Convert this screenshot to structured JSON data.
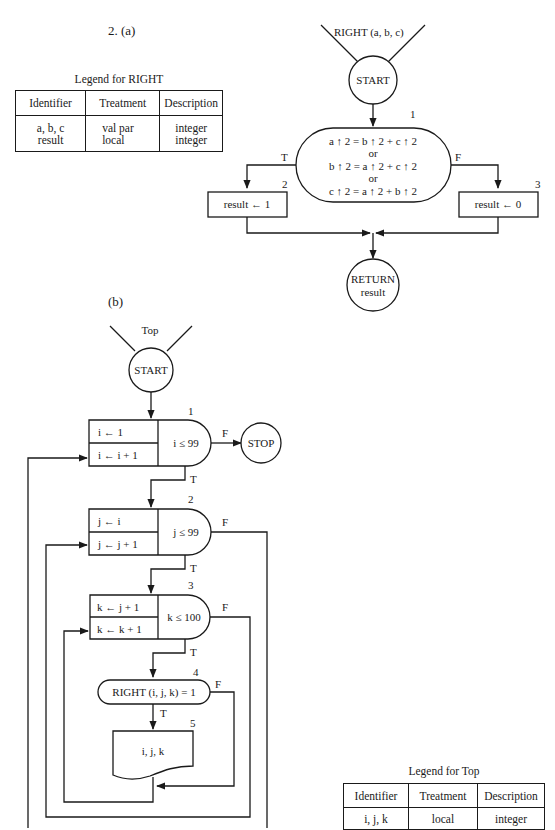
{
  "page": {
    "header_number": "326",
    "exercise": "2. (a)",
    "part_b": "(b)"
  },
  "legend_right": {
    "title": "Legend for RIGHT",
    "headers": [
      "Identifier",
      "Treatment",
      "Description"
    ],
    "rows": [
      [
        "a, b, c",
        "val par",
        "integer"
      ],
      [
        "result",
        "local",
        "integer"
      ]
    ]
  },
  "flow_right": {
    "entry_label": "RIGHT (a, b, c)",
    "start": "START",
    "decision_number": "1",
    "decision_lines": [
      "a ↑ 2 = b ↑ 2 + c ↑ 2",
      "or",
      "b ↑ 2 = a ↑ 2 + c ↑ 2",
      "or",
      "c ↑ 2 = a ↑ 2 + b ↑ 2"
    ],
    "true_label": "T",
    "false_label": "F",
    "box2_number": "2",
    "box2": "result ← 1",
    "box3_number": "3",
    "box3": "result ← 0",
    "return_lines": [
      "RETURN",
      "result"
    ]
  },
  "flow_top": {
    "entry_label": "Top",
    "start": "START",
    "loop1": {
      "number": "1",
      "init": "i ← 1",
      "incr": "i ← i + 1",
      "test": "i ≤ 99",
      "false_label": "F",
      "true_label": "T"
    },
    "stop": "STOP",
    "loop2": {
      "number": "2",
      "init": "j ← i",
      "incr": "j ← j + 1",
      "test": "j ≤ 99",
      "false_label": "F",
      "true_label": "T"
    },
    "loop3": {
      "number": "3",
      "init": "k ← j + 1",
      "incr": "k ← k + 1",
      "test": "k ≤ 100",
      "false_label": "F",
      "true_label": "T"
    },
    "decision4": {
      "number": "4",
      "text": "RIGHT (i, j, k) = 1",
      "false_label": "F",
      "true_label": "T"
    },
    "output5": {
      "number": "5",
      "text": "i, j, k"
    }
  },
  "legend_top": {
    "title": "Legend for Top",
    "headers": [
      "Identifier",
      "Treatment",
      "Description"
    ],
    "rows": [
      [
        "i, j, k",
        "local",
        "integer"
      ]
    ]
  }
}
